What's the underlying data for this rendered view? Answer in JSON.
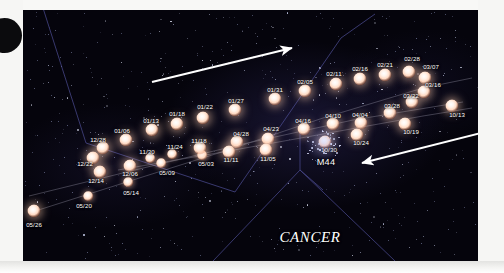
{
  "figure": {
    "kind": "star-chart",
    "constellation_label": "CANCER",
    "cluster_label": "M44",
    "background_color": "#05040c",
    "star_color": "#ffe7d8",
    "constellation_line_color": "#4a4a8e",
    "path_line_color": "#8e8c9e",
    "arrow_color": "#ffffff",
    "label_color": "#ffffff"
  },
  "chart_data": {
    "type": "scatter",
    "title": "",
    "xlabel": "",
    "ylabel": "",
    "annotations": [
      "CANCER",
      "M44"
    ],
    "series": [
      {
        "name": "planet-path-dates",
        "points": [
          {
            "label": "05/26",
            "x": 34,
            "y": 211,
            "size": "lg",
            "lx": 34,
            "ly": 224
          },
          {
            "label": "05/20",
            "x": 88,
            "y": 196,
            "size": "sm",
            "lx": 84,
            "ly": 205
          },
          {
            "label": "05/14",
            "x": 128,
            "y": 182,
            "size": "sm",
            "lx": 131,
            "ly": 192
          },
          {
            "label": "12/14",
            "x": 100,
            "y": 172,
            "size": "lg",
            "lx": 96,
            "ly": 180
          },
          {
            "label": "12/06",
            "x": 130,
            "y": 166,
            "size": "lg",
            "lx": 130,
            "ly": 173
          },
          {
            "label": "12/22",
            "x": 93,
            "y": 158,
            "size": "lg",
            "lx": 85,
            "ly": 163
          },
          {
            "label": "12/28",
            "x": 103,
            "y": 148,
            "size": "lg",
            "lx": 98,
            "ly": 139
          },
          {
            "label": "01/06",
            "x": 126,
            "y": 140,
            "size": "lg",
            "lx": 122,
            "ly": 130
          },
          {
            "label": "05/09",
            "x": 161,
            "y": 163,
            "size": "sm",
            "lx": 167,
            "ly": 172
          },
          {
            "label": "11/30",
            "x": 150,
            "y": 158,
            "size": "sm",
            "lx": 147,
            "ly": 151
          },
          {
            "label": "11/24",
            "x": 172,
            "y": 154,
            "size": "sm",
            "lx": 175,
            "ly": 146
          },
          {
            "label": "05/03",
            "x": 202,
            "y": 155,
            "size": "sm",
            "lx": 206,
            "ly": 163
          },
          {
            "label": "11/18",
            "x": 200,
            "y": 148,
            "size": "lg",
            "lx": 199,
            "ly": 140
          },
          {
            "label": "01/13",
            "x": 152,
            "y": 130,
            "size": "lg",
            "lx": 151,
            "ly": 120
          },
          {
            "label": "01/18",
            "x": 177,
            "y": 124,
            "size": "lg",
            "lx": 177,
            "ly": 113
          },
          {
            "label": "01/22",
            "x": 203,
            "y": 118,
            "size": "lg",
            "lx": 205,
            "ly": 106
          },
          {
            "label": "01/27",
            "x": 235,
            "y": 110,
            "size": "lg",
            "lx": 236,
            "ly": 100
          },
          {
            "label": "04/28",
            "x": 237,
            "y": 142,
            "size": "lg",
            "lx": 241,
            "ly": 133
          },
          {
            "label": "11/11",
            "x": 229,
            "y": 152,
            "size": "lg",
            "lx": 231,
            "ly": 159
          },
          {
            "label": "04/23",
            "x": 268,
            "y": 139,
            "size": "lg",
            "lx": 271,
            "ly": 128
          },
          {
            "label": "11/05",
            "x": 266,
            "y": 150,
            "size": "lg",
            "lx": 268,
            "ly": 158
          },
          {
            "label": "01/31",
            "x": 275,
            "y": 99,
            "size": "lg",
            "lx": 275,
            "ly": 89
          },
          {
            "label": "02/05",
            "x": 305,
            "y": 91,
            "size": "lg",
            "lx": 305,
            "ly": 81
          },
          {
            "label": "04/16",
            "x": 304,
            "y": 129,
            "size": "lg",
            "lx": 303,
            "ly": 120
          },
          {
            "label": "04/10",
            "x": 333,
            "y": 124,
            "size": "lg",
            "lx": 333,
            "ly": 115
          },
          {
            "label": "10/30",
            "x": 325,
            "y": 142,
            "size": "lg",
            "lx": 329,
            "ly": 149
          },
          {
            "label": "02/11",
            "x": 336,
            "y": 84,
            "size": "lg",
            "lx": 334,
            "ly": 73
          },
          {
            "label": "02/16",
            "x": 360,
            "y": 79,
            "size": "lg",
            "lx": 360,
            "ly": 68
          },
          {
            "label": "04/04",
            "x": 361,
            "y": 123,
            "size": "lg",
            "lx": 360,
            "ly": 114
          },
          {
            "label": "10/24",
            "x": 357,
            "y": 135,
            "size": "lg",
            "lx": 361,
            "ly": 142
          },
          {
            "label": "02/21",
            "x": 385,
            "y": 75,
            "size": "lg",
            "lx": 385,
            "ly": 64
          },
          {
            "label": "03/28",
            "x": 390,
            "y": 113,
            "size": "lg",
            "lx": 392,
            "ly": 105
          },
          {
            "label": "10/19",
            "x": 405,
            "y": 124,
            "size": "lg",
            "lx": 411,
            "ly": 131
          },
          {
            "label": "02/28",
            "x": 409,
            "y": 72,
            "size": "lg",
            "lx": 412,
            "ly": 58
          },
          {
            "label": "03/07",
            "x": 425,
            "y": 78,
            "size": "lg",
            "lx": 431,
            "ly": 66
          },
          {
            "label": "03/16",
            "x": 424,
            "y": 92,
            "size": "lg",
            "lx": 433,
            "ly": 84
          },
          {
            "label": "03/22",
            "x": 412,
            "y": 102,
            "size": "lg",
            "lx": 411,
            "ly": 95
          },
          {
            "label": "10/13",
            "x": 452,
            "y": 106,
            "size": "lg",
            "lx": 457,
            "ly": 114
          }
        ]
      }
    ]
  },
  "arrows": [
    {
      "name": "direction-arrow-upper",
      "x1": 152,
      "y1": 82,
      "x2": 292,
      "y2": 48
    },
    {
      "name": "direction-arrow-lower",
      "x1": 481,
      "y1": 133,
      "x2": 362,
      "y2": 163
    }
  ]
}
